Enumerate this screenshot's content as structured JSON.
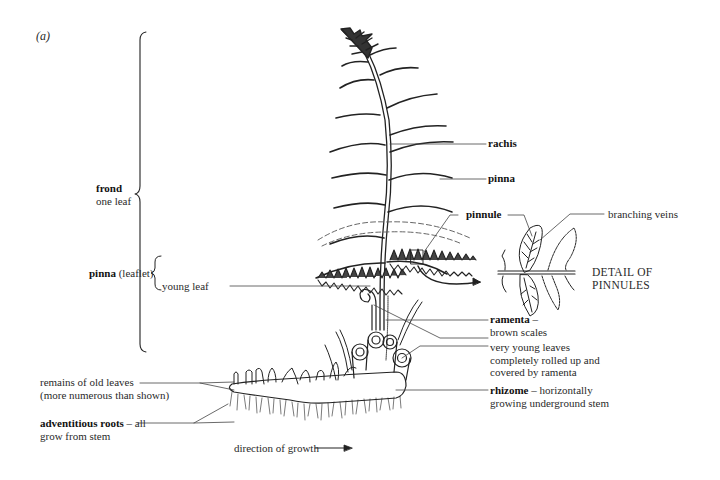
{
  "figure": {
    "panel_label": "(a)"
  },
  "labels": {
    "frond": {
      "term": "frond",
      "desc": "one leaf"
    },
    "rachis": {
      "term": "rachis"
    },
    "pinna": {
      "term": "pinna"
    },
    "pinnule": {
      "term": "pinnule"
    },
    "branching_veins": {
      "desc": "branching veins"
    },
    "pinna_leaflet": {
      "term": "pinna",
      "desc": "(leaflet)"
    },
    "detail_of_pinnules": {
      "line1": "DETAIL OF",
      "line2": "PINNULES"
    },
    "young_leaf": {
      "desc": "young leaf"
    },
    "ramenta": {
      "term": "ramenta",
      "sep": " –",
      "desc": "brown scales"
    },
    "very_young_leaves": {
      "line1": "very young leaves",
      "line2": "completely rolled up and",
      "line3": "covered by ramenta"
    },
    "rhizome": {
      "term": "rhizome",
      "sep": " – horizontally",
      "line2": "growing underground stem"
    },
    "remains_old_leaves": {
      "line1": "remains of old leaves",
      "line2": "(more numerous than shown)"
    },
    "adventitious_roots": {
      "term": "adventitious roots",
      "sep": " – all",
      "line2": "grow from stem"
    },
    "direction_of_growth": {
      "desc": "direction of growth"
    }
  },
  "colors": {
    "ink": "#222222",
    "background": "#ffffff",
    "dashed": "#555555"
  }
}
